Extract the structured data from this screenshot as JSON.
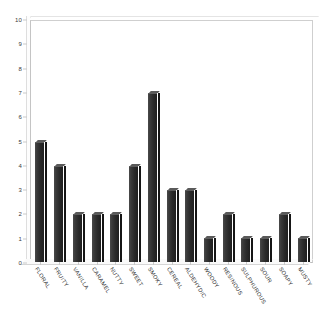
{
  "chart_data": {
    "type": "bar",
    "title": "",
    "subtitle": "",
    "xlabel": "",
    "ylabel": "",
    "ylim": [
      0,
      10
    ],
    "y_ticks": [
      0,
      1,
      2,
      3,
      4,
      5,
      6,
      7,
      8,
      9,
      10
    ],
    "grid": false,
    "legend": false,
    "legend_position": "none",
    "orientation": "vertical",
    "style": "3d-bar",
    "bar_color": "#2a2a2a",
    "plot_background": "#ffffff",
    "frame_color": "#cfcfcf",
    "categories": [
      "FLORAL",
      "FRUITY",
      "VANILLA",
      "CARAMEL",
      "NUTTY",
      "SWEET",
      "SMOKY",
      "CEREAL",
      "ALDEHYDIC",
      "WOODY",
      "RESINOUS",
      "SULPHUROUS",
      "SOUR",
      "SOAPY",
      "MUSTY"
    ],
    "values": [
      5,
      4,
      2,
      2,
      2,
      4,
      7,
      3,
      3,
      1,
      2,
      1,
      1,
      2,
      1
    ]
  }
}
